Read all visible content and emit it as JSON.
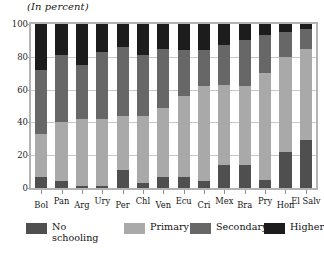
{
  "chart_data": {
    "type": "bar",
    "subtype": "stacked-vertical-percent",
    "title": "(In percent)",
    "xlabel": "",
    "ylabel": "",
    "ylim": [
      0,
      100
    ],
    "yticks": [
      0,
      20,
      40,
      60,
      80,
      100
    ],
    "grid": true,
    "legend_position": "bottom",
    "categories": [
      "Bol",
      "Pan",
      "Arg",
      "Ury",
      "Per",
      "Chl",
      "Ven",
      "Ecu",
      "Cri",
      "Mex",
      "Bra",
      "Pry",
      "Hon",
      "El Salv"
    ],
    "series": [
      {
        "name": "No schooling",
        "color": "#4f4f4f",
        "values": [
          7,
          4,
          1,
          1,
          11,
          3,
          7,
          7,
          4,
          14,
          14,
          5,
          22,
          29
        ]
      },
      {
        "name": "Primary",
        "color": "#a9a9a9",
        "values": [
          26,
          36,
          41,
          41,
          33,
          41,
          42,
          49,
          58,
          49,
          48,
          65,
          58,
          56
        ]
      },
      {
        "name": "Secondary",
        "color": "#676767",
        "values": [
          39,
          41,
          33,
          41,
          42,
          37,
          36,
          28,
          22,
          24,
          28,
          23,
          15,
          12
        ]
      },
      {
        "name": "Higher",
        "color": "#1c1c1c",
        "values": [
          28,
          19,
          25,
          17,
          14,
          19,
          15,
          16,
          16,
          13,
          10,
          7,
          5,
          3
        ]
      }
    ]
  },
  "legend": {
    "items": [
      {
        "label": "No\nschooling",
        "color": "#4f4f4f"
      },
      {
        "label": "Primary",
        "color": "#a9a9a9"
      },
      {
        "label": "Secondary",
        "color": "#676767"
      },
      {
        "label": "Higher",
        "color": "#1c1c1c"
      }
    ]
  },
  "axis": {
    "y_tick_labels": [
      "100",
      "80",
      "60",
      "40",
      "20",
      "0"
    ]
  }
}
